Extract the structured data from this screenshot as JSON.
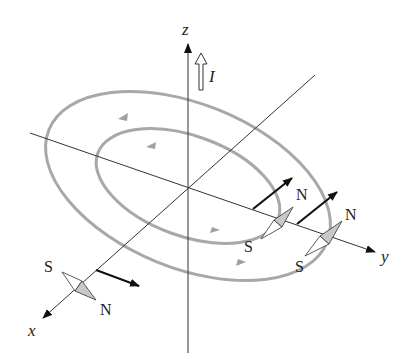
{
  "diagram": {
    "title": "",
    "axes": {
      "x_label": "x",
      "y_label": "y",
      "z_label": "z"
    },
    "current": {
      "label": "I",
      "direction": "+z"
    },
    "field_lines": [
      {
        "name": "outer-ring",
        "direction": "counterclockwise (viewed from +z)"
      },
      {
        "name": "inner-ring",
        "direction": "counterclockwise (viewed from +z)"
      }
    ],
    "compasses": [
      {
        "name": "compass-on-x-axis",
        "south_label": "S",
        "north_label": "N"
      },
      {
        "name": "compass-inner-y-axis",
        "south_label": "S",
        "north_label": "N"
      },
      {
        "name": "compass-outer-y-axis",
        "south_label": "S",
        "north_label": "N"
      }
    ],
    "colors": {
      "axis": "#333333",
      "field_line": "#a8a8a8",
      "field_vector": "#111111",
      "needle_north_fill": "#c8c8c8",
      "needle_south_fill": "#ffffff"
    }
  }
}
